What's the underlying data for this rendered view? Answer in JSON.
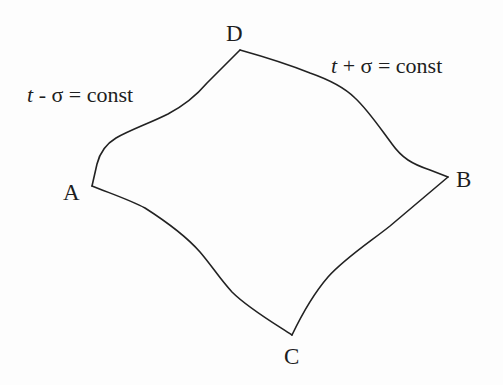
{
  "diagram": {
    "type": "curvilinear-quadrilateral",
    "vertices": [
      {
        "id": "A",
        "label": "A",
        "x": 92,
        "y": 186
      },
      {
        "id": "B",
        "label": "B",
        "x": 448,
        "y": 177
      },
      {
        "id": "C",
        "label": "C",
        "x": 292,
        "y": 335
      },
      {
        "id": "D",
        "label": "D",
        "x": 240,
        "y": 50
      }
    ],
    "edges": [
      {
        "from": "A",
        "to": "D",
        "family": "t - σ = const"
      },
      {
        "from": "D",
        "to": "B",
        "family": "t + σ = const"
      },
      {
        "from": "B",
        "to": "C",
        "family": "t - σ = const"
      },
      {
        "from": "C",
        "to": "A",
        "family": "t + σ = const"
      }
    ],
    "labels": {
      "minus_curve": {
        "var": "t",
        "op": " - ",
        "sigma": "σ",
        "rest": " = const"
      },
      "plus_curve": {
        "var": "t",
        "op": " + ",
        "sigma": "σ",
        "rest": " = const"
      }
    },
    "stroke_color": "#222222"
  }
}
